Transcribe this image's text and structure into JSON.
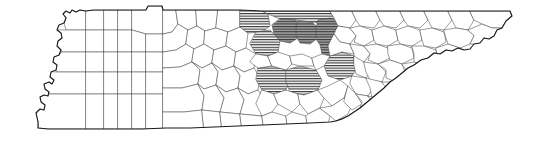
{
  "figure": {
    "title": "Tennessee county map",
    "subject": "Tennessee",
    "type": "choropleth-outline-map",
    "background_color": "#ffffff",
    "county_fill_color": "#ffffff",
    "county_border_color": "#4a4a4a",
    "state_border_color": "#1a1a1a",
    "highlight_hatch_color": "#333333",
    "highlight_shade_color": "#a8a8a8"
  },
  "legend": {
    "visible": false,
    "entries": [
      {
        "key": "plain",
        "label": "Not highlighted",
        "swatch": "#ffffff"
      },
      {
        "key": "hatched",
        "label": "Highlighted (hatched)",
        "swatch": "#333333"
      },
      {
        "key": "shaded",
        "label": "Highlighted (shaded + hatched)",
        "swatch": "#a8a8a8"
      }
    ]
  },
  "chart_data": {
    "type": "map",
    "title": "Tennessee county map",
    "xlabel": "",
    "ylabel": "",
    "regions_total": 95,
    "regions_highlighted": 9,
    "categories": [
      "plain",
      "hatched",
      "shaded"
    ],
    "values": [
      86,
      6,
      3
    ],
    "highlighted_regions": [
      {
        "id": "hl-1",
        "style": "hatched",
        "position": "north-central, top edge, west of cluster"
      },
      {
        "id": "hl-2",
        "style": "hatched",
        "position": "north-central, top edge"
      },
      {
        "id": "hl-3",
        "style": "shaded",
        "position": "north-central, upper cluster, west"
      },
      {
        "id": "hl-4",
        "style": "shaded",
        "position": "north-central, upper cluster, middle"
      },
      {
        "id": "hl-5",
        "style": "shaded",
        "position": "north-central, upper cluster, east"
      },
      {
        "id": "hl-6",
        "style": "hatched",
        "position": "central, west of cluster"
      },
      {
        "id": "hl-7",
        "style": "hatched",
        "position": "central, east of cluster"
      },
      {
        "id": "hl-8",
        "style": "hatched",
        "position": "central, lower cluster, west"
      },
      {
        "id": "hl-9",
        "style": "hatched",
        "position": "central, lower cluster, east"
      }
    ]
  },
  "map": {
    "state_outline": "M 38,122 L 36,113 L 40,109 L 44,110 L 45,105 L 41,102 L 40,97 L 44,95 L 48,96 L 49,92 L 45,89 L 44,84 L 49,82 L 52,84 L 54,80 L 50,77 L 51,72 L 56,70 L 57,65 L 53,62 L 54,57 L 59,55 L 61,50 L 57,46 L 58,41 L 62,38 L 61,33 L 57,30 L 59,25 L 64,23 L 66,18 L 63,14 L 66,11 L 70,13 L 72,10 L 76,12 L 80,10 L 86,11 L 93,10 L 104,10 L 118,10 L 132,10 L 146,10 L 148,6 L 162,6 L 163,10 L 176,10 L 196,10 L 218,10 L 240,10 L 262,11 L 284,11 L 306,11 L 330,11 L 352,11 L 376,11 L 400,11 L 424,11 L 448,11 L 470,11 L 492,11 L 510,11 L 512,16 L 506,21 L 502,28 L 497,30 L 494,36 L 489,39 L 484,38 L 480,43 L 474,44 L 470,49 L 464,50 L 458,48 L 452,51 L 446,50 L 440,54 L 434,53 L 428,58 L 421,60 L 414,65 L 408,68 L 402,73 L 396,78 L 390,82 L 384,88 L 378,93 L 372,98 L 366,103 L 360,108 L 354,112 L 348,116 L 342,119 L 336,121 L 330,122 L 310,123 L 286,124 L 262,125 L 238,126 L 214,127 L 190,128 L 166,128 L 142,129 L 118,129 L 94,129 L 70,129 L 48,129 L 38,128 Z"
  }
}
